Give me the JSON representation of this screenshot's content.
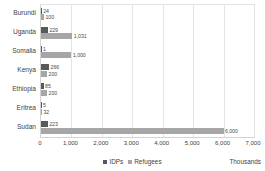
{
  "chart_data": {
    "type": "bar",
    "orientation": "horizontal",
    "title": "",
    "subtitle": "",
    "xlabel": "",
    "ylabel": "",
    "units_note": "Thousands",
    "xlim": [
      0,
      7000
    ],
    "xticks": [
      0,
      1000,
      2000,
      3000,
      4000,
      5000,
      6000,
      7000
    ],
    "xtick_labels": [
      "0",
      "1,000",
      "2,000",
      "3,000",
      "4,000",
      "5,000",
      "6,000",
      "7,000"
    ],
    "grid": true,
    "grid_axis": "x",
    "legend_position": "bottom-center",
    "categories": [
      "Burundi",
      "Uganda",
      "Somalia",
      "Kenya",
      "Ethiopia",
      "Eritrea",
      "Sudan"
    ],
    "series": [
      {
        "name": "IDPs",
        "color": "#595959",
        "values": [
          24,
          229,
          1,
          266,
          85,
          5,
          223
        ],
        "labels": [
          "24",
          "229",
          "1",
          "266",
          "85",
          "5",
          "223"
        ]
      },
      {
        "name": "Refugees",
        "color": "#a6a6a6",
        "values": [
          100,
          1031,
          1000,
          200,
          200,
          32,
          6000
        ],
        "labels": [
          "100",
          "1,031",
          "1,000",
          "200",
          "200",
          "32",
          "6,000"
        ]
      }
    ]
  },
  "legend": {
    "items": [
      {
        "label": "IDPs",
        "color": "#595959"
      },
      {
        "label": "Refugees",
        "color": "#a6a6a6"
      }
    ]
  }
}
